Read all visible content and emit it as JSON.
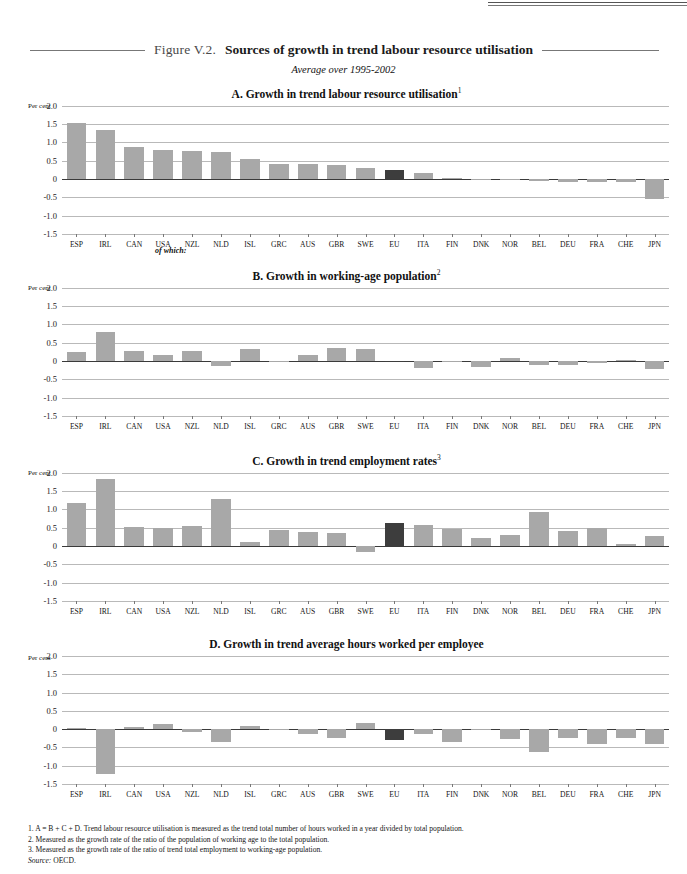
{
  "figure": {
    "label": "Figure V.2.",
    "title": "Sources of growth in trend labour resource utilisation",
    "subtitle": "Average over 1995-2002",
    "of_which": "of which:",
    "per_cent_label": "Per cent"
  },
  "colors": {
    "bar": "#a8a8a8",
    "highlight_bar": "#3d3d3d",
    "gridline": "#b9b9b9",
    "zero_line": "#3a3a3a"
  },
  "notes": {
    "n1": "1.  A = B + C + D. Trend labour resource utilisation is measured as the trend total number of hours worked in a year divided by total population.",
    "n2": "2.  Measured as the growth rate of the ratio of the population of working age to the total population.",
    "n3": "3.  Measured as the growth rate of the ratio of trend total employment to working-age population.",
    "source_label": "Source:",
    "source_value": "OECD."
  },
  "chart_data": [
    {
      "type": "bar",
      "panel": "A",
      "title": "A.  Growth in trend labour resource utilisation",
      "footnote_marker": "1",
      "ylabel": "Per cent",
      "ylim": [
        -1.5,
        2.0
      ],
      "yticks": [
        2.0,
        1.5,
        1.0,
        0.5,
        0,
        -0.5,
        -1.0,
        -1.5
      ],
      "ytick_labels": [
        "2.0",
        "1.5",
        "1.0",
        "0.5",
        "0",
        "-0.5",
        "-1.0",
        "-1.5"
      ],
      "grid": true,
      "legend": "none",
      "highlight": "EU",
      "categories": [
        "ESP",
        "IRL",
        "CAN",
        "USA",
        "NZL",
        "NLD",
        "ISL",
        "GRC",
        "AUS",
        "GBR",
        "SWE",
        "EU",
        "ITA",
        "FIN",
        "DNK",
        "NOR",
        "BEL",
        "DEU",
        "FRA",
        "CHE",
        "JPN"
      ],
      "values": [
        1.52,
        1.35,
        0.88,
        0.79,
        0.77,
        0.75,
        0.55,
        0.42,
        0.4,
        0.38,
        0.31,
        0.25,
        0.17,
        0.02,
        -0.01,
        -0.02,
        -0.06,
        -0.08,
        -0.08,
        -0.08,
        -0.56
      ]
    },
    {
      "type": "bar",
      "panel": "B",
      "title": "B.  Growth in working-age population",
      "footnote_marker": "2",
      "ylabel": "Per cent",
      "ylim": [
        -1.5,
        2.0
      ],
      "yticks": [
        2.0,
        1.5,
        1.0,
        0.5,
        0,
        -0.5,
        -1.0,
        -1.5
      ],
      "ytick_labels": [
        "2.0",
        "1.5",
        "1.0",
        "0.5",
        "0",
        "-0.5",
        "-1.0",
        "-1.5"
      ],
      "grid": true,
      "legend": "none",
      "highlight": "EU",
      "categories": [
        "ESP",
        "IRL",
        "CAN",
        "USA",
        "NZL",
        "NLD",
        "ISL",
        "GRC",
        "AUS",
        "GBR",
        "SWE",
        "EU",
        "ITA",
        "FIN",
        "DNK",
        "NOR",
        "BEL",
        "DEU",
        "FRA",
        "CHE",
        "JPN"
      ],
      "values": [
        0.24,
        0.78,
        0.28,
        0.15,
        0.28,
        -0.15,
        0.32,
        -0.04,
        0.16,
        0.35,
        0.32,
        -0.02,
        -0.18,
        -0.02,
        -0.17,
        0.08,
        -0.1,
        -0.12,
        -0.05,
        0.02,
        -0.22
      ]
    },
    {
      "type": "bar",
      "panel": "C",
      "title": "C.  Growth in trend employment rates",
      "footnote_marker": "3",
      "ylabel": "Per cent",
      "ylim": [
        -1.5,
        2.0
      ],
      "yticks": [
        2.0,
        1.5,
        1.0,
        0.5,
        0,
        -0.5,
        -1.0,
        -1.5
      ],
      "ytick_labels": [
        "2.0",
        "1.5",
        "1.0",
        "0.5",
        "0",
        "-0.5",
        "-1.0",
        "-1.5"
      ],
      "grid": true,
      "legend": "none",
      "highlight": "EU",
      "categories": [
        "ESP",
        "IRL",
        "CAN",
        "USA",
        "NZL",
        "NLD",
        "ISL",
        "GRC",
        "AUS",
        "GBR",
        "SWE",
        "EU",
        "ITA",
        "FIN",
        "DNK",
        "NOR",
        "BEL",
        "DEU",
        "FRA",
        "CHE",
        "JPN"
      ],
      "values": [
        1.18,
        1.84,
        0.52,
        0.48,
        0.54,
        1.29,
        0.11,
        0.45,
        0.39,
        0.35,
        -0.17,
        0.62,
        0.57,
        0.46,
        0.21,
        0.29,
        0.92,
        0.41,
        0.49,
        0.06,
        0.28
      ]
    },
    {
      "type": "bar",
      "panel": "D",
      "title": "D.  Growth in trend average hours worked per employee",
      "footnote_marker": "",
      "ylabel": "Per cent",
      "ylim": [
        -1.5,
        2.0
      ],
      "yticks": [
        2.0,
        1.5,
        1.0,
        0.5,
        0,
        -0.5,
        -1.0,
        -1.5
      ],
      "ytick_labels": [
        "2.0",
        "1.5",
        "1.0",
        "0.5",
        "0",
        "-0.5",
        "-1.0",
        "-1.5"
      ],
      "grid": true,
      "legend": "none",
      "highlight": "EU",
      "categories": [
        "ESP",
        "IRL",
        "CAN",
        "USA",
        "NZL",
        "NLD",
        "ISL",
        "GRC",
        "AUS",
        "GBR",
        "SWE",
        "EU",
        "ITA",
        "FIN",
        "DNK",
        "NOR",
        "BEL",
        "DEU",
        "FRA",
        "CHE",
        "JPN"
      ],
      "values": [
        0.04,
        -1.23,
        0.05,
        0.13,
        -0.07,
        -0.34,
        0.08,
        -0.01,
        -0.12,
        -0.25,
        0.18,
        -0.29,
        -0.13,
        -0.35,
        0.01,
        -0.28,
        -0.62,
        -0.25,
        -0.4,
        -0.25,
        -0.4
      ]
    }
  ]
}
